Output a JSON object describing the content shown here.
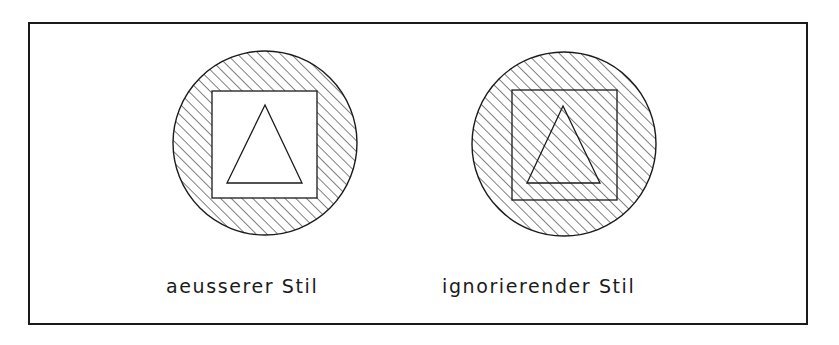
{
  "diagram": {
    "colors": {
      "background": "#ffffff",
      "stroke": "#1a1a1a"
    },
    "frame": {
      "x": 29,
      "y": 23,
      "width": 778,
      "height": 301,
      "stroke_width": 2
    },
    "hatch": {
      "angle_deg": 45,
      "spacing": 7.6,
      "stroke_width": 1
    },
    "figures": [
      {
        "id": "outer-style",
        "label": "aeusserer Stil",
        "label_pos": {
          "x": 166,
          "y": 293
        },
        "circle": {
          "cx": 265,
          "cy": 143,
          "r": 92
        },
        "square": {
          "x": 212,
          "y": 91,
          "width": 105,
          "height": 107
        },
        "triangle": [
          [
            265,
            105
          ],
          [
            227,
            183
          ],
          [
            302,
            183
          ]
        ],
        "hatch_mode": "outer"
      },
      {
        "id": "ignore-style",
        "label": "ignorierender Stil",
        "label_pos": {
          "x": 442,
          "y": 293
        },
        "circle": {
          "cx": 564,
          "cy": 144,
          "r": 92
        },
        "square": {
          "x": 512,
          "y": 90,
          "width": 105,
          "height": 110
        },
        "triangle": [
          [
            563,
            106
          ],
          [
            527,
            183
          ],
          [
            600,
            183
          ]
        ],
        "hatch_mode": "ignore"
      }
    ]
  }
}
